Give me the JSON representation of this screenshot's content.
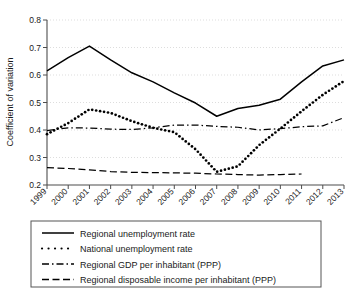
{
  "chart_data": {
    "type": "line",
    "title": "",
    "xlabel": "",
    "ylabel": "Coefficient of variation",
    "x": [
      1999,
      2000,
      2001,
      2002,
      2003,
      2004,
      2005,
      2006,
      2007,
      2008,
      2009,
      2010,
      2011,
      2012,
      2013
    ],
    "categories": [
      "1999",
      "2000",
      "2001",
      "2002",
      "2003",
      "2004",
      "2005",
      "2006",
      "2007",
      "2008",
      "2009",
      "2010",
      "2011",
      "2012",
      "2013"
    ],
    "ylim": [
      0.2,
      0.8
    ],
    "xlim": [
      1999,
      2013
    ],
    "yticks": [
      0.2,
      0.3,
      0.4,
      0.5,
      0.6,
      0.7,
      0.8
    ],
    "ytick_labels": [
      "0.2",
      "0.3",
      "0.4",
      "0.5",
      "0.6",
      "0.7",
      "0.8"
    ],
    "grid": "horizontal-dotted",
    "legend_position": "below-plot",
    "series": [
      {
        "name": "Regional unemployment rate",
        "style": "solid",
        "color": "#000000",
        "values": [
          0.615,
          0.663,
          0.705,
          0.655,
          0.608,
          0.575,
          0.535,
          0.498,
          0.45,
          0.478,
          0.49,
          0.512,
          0.575,
          0.633,
          0.655
        ]
      },
      {
        "name": "National unemployment rate",
        "style": "dotted",
        "color": "#000000",
        "values": [
          0.385,
          0.425,
          0.475,
          0.462,
          0.432,
          0.408,
          0.392,
          0.33,
          0.248,
          0.268,
          0.345,
          0.405,
          0.468,
          0.528,
          0.578
        ]
      },
      {
        "name": "Regional GDP per inhabitant (PPP)",
        "style": "dashdot",
        "color": "#000000",
        "values": [
          0.398,
          0.408,
          0.407,
          0.403,
          0.402,
          0.408,
          0.418,
          0.418,
          0.413,
          0.41,
          0.4,
          0.405,
          0.412,
          0.415,
          0.445
        ]
      },
      {
        "name": "Regional disposable income per inhabitant (PPP)",
        "style": "dashed",
        "color": "#000000",
        "values": [
          0.263,
          0.26,
          0.255,
          0.249,
          0.246,
          0.245,
          0.244,
          0.243,
          0.24,
          0.238,
          0.236,
          0.238,
          0.24,
          null,
          null
        ]
      }
    ]
  },
  "axis": {
    "y_title": "Coefficient of variation",
    "y_ticks": [
      "0.8",
      "0.7",
      "0.6",
      "0.5",
      "0.4",
      "0.3",
      "0.2"
    ],
    "x_ticks": [
      "1999",
      "2000",
      "2001",
      "2002",
      "2003",
      "2004",
      "2005",
      "2006",
      "2007",
      "2008",
      "2009",
      "2010",
      "2011",
      "2012",
      "2013"
    ]
  },
  "legend": {
    "items": [
      {
        "label": "Regional unemployment rate",
        "style": "solid"
      },
      {
        "label": "National unemployment rate",
        "style": "dotted"
      },
      {
        "label": "Regional GDP per inhabitant (PPP)",
        "style": "dashdot"
      },
      {
        "label": "Regional disposable income per inhabitant (PPP)",
        "style": "dashed"
      }
    ]
  },
  "colors": {
    "ink": "#000000",
    "grid": "#c8c8c8",
    "axis": "#4d4d4d",
    "background": "#ffffff"
  }
}
